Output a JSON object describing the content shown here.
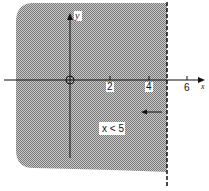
{
  "diagram": {
    "type": "inequality-graph",
    "inequality_label": "x < 5",
    "boundary": {
      "x": 5,
      "style": "dashed"
    },
    "x_axis": {
      "label": "x",
      "ticks": [
        "2",
        "4",
        "6"
      ]
    },
    "y_axis": {
      "label": "y"
    },
    "origin_label": "O",
    "shading_direction": "left",
    "colors": {
      "shade": "#9a9a9a",
      "axis": "#111111",
      "background": "#ffffff"
    }
  }
}
